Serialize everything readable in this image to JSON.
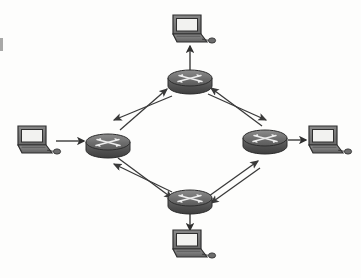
{
  "diagram": {
    "type": "network-topology",
    "background_color": "#fdfdfc",
    "line_color": "#3a3a3a",
    "device_fill": "#6e6e6e",
    "device_dark": "#4a4a4a",
    "device_light": "#9a9a9a",
    "screen_fill": "#f2f2f0",
    "nodes": [
      {
        "id": "router-top",
        "kind": "router",
        "label": "Router",
        "x": 190,
        "y": 80
      },
      {
        "id": "router-left",
        "kind": "router",
        "label": "Router",
        "x": 108,
        "y": 144
      },
      {
        "id": "router-right",
        "kind": "router",
        "label": "Router",
        "x": 265,
        "y": 140
      },
      {
        "id": "router-bottom",
        "kind": "router",
        "label": "Router",
        "x": 190,
        "y": 200
      },
      {
        "id": "laptop-top",
        "kind": "computer",
        "label": "PC",
        "x": 190,
        "y": 30
      },
      {
        "id": "laptop-left",
        "kind": "computer",
        "label": "PC",
        "x": 35,
        "y": 141
      },
      {
        "id": "laptop-right",
        "kind": "computer",
        "label": "PC",
        "x": 326,
        "y": 141
      },
      {
        "id": "laptop-bottom",
        "kind": "computer",
        "label": "PC",
        "x": 190,
        "y": 245
      }
    ],
    "links": [
      {
        "id": "link-left-top",
        "from": "router-left",
        "to": "router-top",
        "style": "double-arrow",
        "direction": "bidirectional"
      },
      {
        "id": "link-top-right",
        "from": "router-top",
        "to": "router-right",
        "style": "double-arrow",
        "direction": "bidirectional"
      },
      {
        "id": "link-left-bottom",
        "from": "router-left",
        "to": "router-bottom",
        "style": "double-arrow",
        "direction": "bidirectional"
      },
      {
        "id": "link-bottom-right",
        "from": "router-bottom",
        "to": "router-right",
        "style": "double-arrow",
        "direction": "bidirectional"
      },
      {
        "id": "link-laptop-left",
        "from": "laptop-left",
        "to": "router-left",
        "style": "single-arrow",
        "direction": "right"
      },
      {
        "id": "link-laptop-top",
        "from": "router-top",
        "to": "laptop-top",
        "style": "single-arrow",
        "direction": "up"
      },
      {
        "id": "link-laptop-right",
        "from": "router-right",
        "to": "laptop-right",
        "style": "single-arrow",
        "direction": "right"
      },
      {
        "id": "link-laptop-bottom",
        "from": "router-bottom",
        "to": "laptop-bottom",
        "style": "single-arrow",
        "direction": "down"
      }
    ],
    "artifacts": [
      {
        "id": "scan-mark-left",
        "x": 0,
        "y": 38,
        "width": 4,
        "height": 13
      }
    ]
  }
}
